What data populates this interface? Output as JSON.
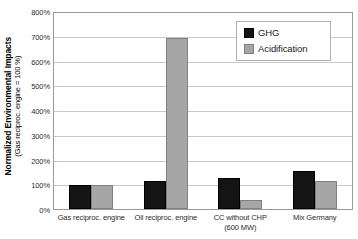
{
  "chart_data": {
    "type": "bar",
    "title": "",
    "xlabel": "",
    "ylabel": "Normalized Environmental Impacts",
    "ylabel_sub": "(Gas reciproc. engine = 100 %)",
    "ylim": [
      0,
      800
    ],
    "ytick_step": 100,
    "ytick_labels": [
      "800%",
      "700%",
      "600%",
      "500%",
      "400%",
      "300%",
      "200%",
      "100%",
      "0%"
    ],
    "ytick_values": [
      800,
      700,
      600,
      500,
      400,
      300,
      200,
      100,
      0
    ],
    "grid": true,
    "legend_position": "top-right",
    "categories": [
      "Gas reciproc. engine",
      "Oil reciproc. engine",
      "CC without CHP (600 MW)",
      "Mix Germany"
    ],
    "category_lines": [
      [
        "Gas reciproc. engine"
      ],
      [
        "Oil reciproc. engine"
      ],
      [
        "CC without CHP",
        "(600 MW)"
      ],
      [
        "Mix Germany"
      ]
    ],
    "series": [
      {
        "name": "GHG",
        "color": "#141414",
        "values": [
          100,
          115,
          125,
          157
        ]
      },
      {
        "name": "Acidification",
        "color": "#a6a6a6",
        "values": [
          100,
          700,
          35,
          115
        ]
      }
    ]
  },
  "legend": {
    "items": [
      {
        "label": "GHG",
        "swatch": "black-square-swatch"
      },
      {
        "label": "Acidification",
        "swatch": "gray-square-swatch"
      }
    ]
  }
}
